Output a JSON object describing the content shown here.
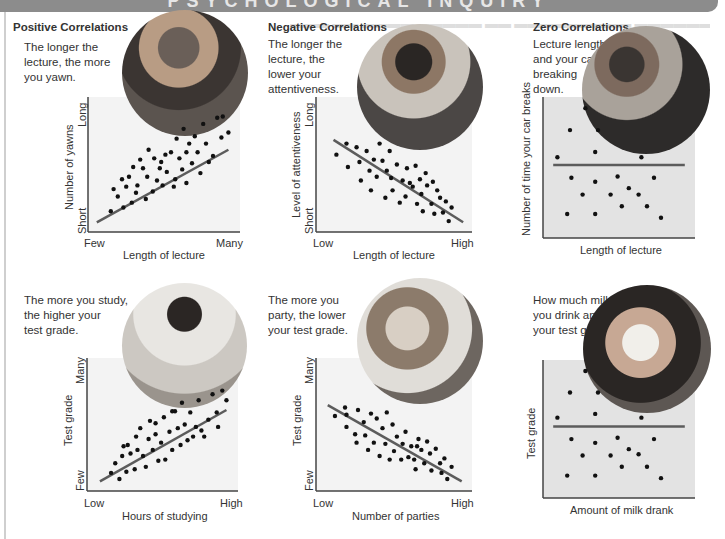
{
  "banner": {
    "title": "PSYCHOLOGICAL INQUIRY"
  },
  "sections": {
    "positive": "Positive Correlations",
    "negative": "Negative Correlations",
    "zero": "Zero Correlations"
  },
  "colors": {
    "banner": "#8c8c8c",
    "line": "#5c5c5c",
    "dot": "#111111",
    "zero_box": "#e3e3e3",
    "axis": "#444444"
  },
  "panels": [
    {
      "id": "positive-top",
      "caption": "The longer the lecture, the more you yawn.",
      "caption_lines": [
        "The longer the",
        "lecture, the more",
        "you yawn."
      ],
      "photo": "woman-yawning-photo",
      "ylabel": "Number of yawns",
      "xlabel": "Length of lecture",
      "ytick_high": "Long",
      "ytick_low": "Short",
      "xtick_low": "Few",
      "xtick_high": "Many"
    },
    {
      "id": "negative-top",
      "caption": "The longer the lecture, the lower your attentiveness.",
      "caption_lines": [
        "The longer the",
        "lecture, the",
        "lower your",
        "attentiveness."
      ],
      "photo": "student-bored-photo",
      "ylabel": "Level of attentiveness",
      "xlabel": "Length of lecture",
      "ytick_high": "Long",
      "ytick_low": "Short",
      "xtick_low": "Low",
      "xtick_high": "High"
    },
    {
      "id": "zero-top",
      "caption": "Lecture length and your car breaking down.",
      "caption_lines": [
        "Lecture length",
        "and your car",
        "breaking",
        "down."
      ],
      "photo": "mechanics-photo",
      "ylabel": "Number of time your car breaks",
      "xlabel": "Length of lecture"
    },
    {
      "id": "positive-bottom",
      "caption": "The more you study, the higher your test grade.",
      "caption_lines": [
        "The more you study,",
        "the higher your",
        "test grade."
      ],
      "photo": "student-studying-photo",
      "ylabel": "Test grade",
      "xlabel": "Hours of studying",
      "ytick_high": "Many",
      "ytick_low": "Few",
      "xtick_low": "Low",
      "xtick_high": "High"
    },
    {
      "id": "negative-bottom",
      "caption": "The more you party, the lower your test grade.",
      "caption_lines": [
        "The more you",
        "party, the lower",
        "your test grade."
      ],
      "photo": "friends-partying-photo",
      "ylabel": "Test grade",
      "xlabel": "Number of parties",
      "ytick_high": "Many",
      "ytick_low": "Few",
      "xtick_low": "Low",
      "xtick_high": "High"
    },
    {
      "id": "zero-bottom",
      "caption": "How much milk you drink and your test grade.",
      "caption_lines": [
        "How much milk",
        "you drink and",
        "your test grade."
      ],
      "photo": "woman-drinking-milk-photo",
      "ylabel": "Test grade",
      "xlabel": "Amount of milk drank"
    }
  ],
  "chart_data": [
    {
      "type": "scatter",
      "title": "Positive Correlations",
      "subtitle": "The longer the lecture, the more you yawn.",
      "xlabel": "Length of lecture",
      "ylabel": "Number of yawns",
      "x_tick_labels": [
        "Few",
        "Many"
      ],
      "y_tick_labels": [
        "Short",
        "Long"
      ],
      "xlim": [
        0,
        100
      ],
      "ylim": [
        0,
        100
      ],
      "grid": false,
      "trendline": {
        "x": [
          2,
          96
        ],
        "y": [
          3,
          62
        ]
      },
      "points": [
        [
          12,
          12
        ],
        [
          14,
          30
        ],
        [
          17,
          24
        ],
        [
          21,
          15
        ],
        [
          23,
          32
        ],
        [
          25,
          40
        ],
        [
          27,
          19
        ],
        [
          28,
          48
        ],
        [
          31,
          33
        ],
        [
          33,
          54
        ],
        [
          35,
          47
        ],
        [
          37,
          22
        ],
        [
          38,
          40
        ],
        [
          39,
          62
        ],
        [
          42,
          28
        ],
        [
          43,
          55
        ],
        [
          45,
          37
        ],
        [
          47,
          47
        ],
        [
          49,
          33
        ],
        [
          51,
          58
        ],
        [
          52,
          44
        ],
        [
          55,
          60
        ],
        [
          57,
          32
        ],
        [
          59,
          71
        ],
        [
          61,
          55
        ],
        [
          63,
          46
        ],
        [
          64,
          79
        ],
        [
          66,
          35
        ],
        [
          68,
          67
        ],
        [
          70,
          51
        ],
        [
          72,
          73
        ],
        [
          74,
          60
        ],
        [
          76,
          43
        ],
        [
          78,
          83
        ],
        [
          80,
          67
        ],
        [
          82,
          52
        ],
        [
          85,
          57
        ],
        [
          88,
          88
        ],
        [
          91,
          72
        ],
        [
          92,
          89
        ],
        [
          96,
          76
        ],
        [
          20,
          38
        ],
        [
          30,
          27
        ],
        [
          48,
          52
        ],
        [
          58,
          38
        ],
        [
          66,
          60
        ]
      ]
    },
    {
      "type": "scatter",
      "title": "Negative Correlations",
      "subtitle": "The longer the lecture, the lower your attentiveness.",
      "xlabel": "Length of lecture",
      "ylabel": "Level of attentiveness",
      "x_tick_labels": [
        "Low",
        "High"
      ],
      "y_tick_labels": [
        "Short",
        "Long"
      ],
      "xlim": [
        0,
        100
      ],
      "ylim": [
        0,
        100
      ],
      "grid": false,
      "trendline": {
        "x": [
          8,
          98
        ],
        "y": [
          70,
          3
        ]
      },
      "points": [
        [
          10,
          58
        ],
        [
          17,
          67
        ],
        [
          18,
          48
        ],
        [
          24,
          64
        ],
        [
          26,
          52
        ],
        [
          27,
          37
        ],
        [
          31,
          61
        ],
        [
          33,
          45
        ],
        [
          34,
          29
        ],
        [
          36,
          54
        ],
        [
          38,
          40
        ],
        [
          40,
          67
        ],
        [
          42,
          53
        ],
        [
          44,
          23
        ],
        [
          45,
          45
        ],
        [
          47,
          61
        ],
        [
          48,
          39
        ],
        [
          49,
          29
        ],
        [
          52,
          50
        ],
        [
          54,
          19
        ],
        [
          56,
          37
        ],
        [
          58,
          24
        ],
        [
          59,
          47
        ],
        [
          61,
          35
        ],
        [
          63,
          32
        ],
        [
          65,
          49
        ],
        [
          66,
          18
        ],
        [
          68,
          38
        ],
        [
          69,
          26
        ],
        [
          70,
          12
        ],
        [
          72,
          43
        ],
        [
          73,
          33
        ],
        [
          76,
          18
        ],
        [
          77,
          36
        ],
        [
          78,
          10
        ],
        [
          80,
          29
        ],
        [
          82,
          23
        ],
        [
          84,
          11
        ],
        [
          86,
          20
        ],
        [
          88,
          4
        ],
        [
          90,
          15
        ]
      ]
    },
    {
      "type": "scatter",
      "title": "Zero Correlations",
      "subtitle": "Lecture length and your car breaking down.",
      "xlabel": "Length of lecture",
      "ylabel": "Number of time your car breaks",
      "xlim": [
        0,
        100
      ],
      "ylim": [
        0,
        100
      ],
      "grid": false,
      "trendline": {
        "x": [
          3,
          97
        ],
        "y": [
          52,
          52
        ]
      },
      "points": [
        [
          6,
          58
        ],
        [
          15,
          79
        ],
        [
          26,
          96
        ],
        [
          35,
          79
        ],
        [
          33,
          62
        ],
        [
          16,
          42
        ],
        [
          24,
          29
        ],
        [
          33,
          39
        ],
        [
          49,
          43
        ],
        [
          57,
          34
        ],
        [
          44,
          29
        ],
        [
          66,
          58
        ],
        [
          64,
          29
        ],
        [
          75,
          42
        ],
        [
          13,
          14
        ],
        [
          33,
          14
        ],
        [
          52,
          20
        ],
        [
          70,
          20
        ],
        [
          80,
          11
        ]
      ]
    },
    {
      "type": "scatter",
      "title": "Positive Correlations",
      "subtitle": "The more you study, the higher your test grade.",
      "xlabel": "Hours of studying",
      "ylabel": "Test grade",
      "x_tick_labels": [
        "Low",
        "High"
      ],
      "y_tick_labels": [
        "Few",
        "Many"
      ],
      "xlim": [
        0,
        100
      ],
      "ylim": [
        0,
        100
      ],
      "grid": false,
      "trendline": {
        "x": [
          5,
          96
        ],
        "y": [
          3,
          62
        ]
      },
      "points": [
        [
          13,
          10
        ],
        [
          16,
          18
        ],
        [
          19,
          5
        ],
        [
          21,
          24
        ],
        [
          24,
          11
        ],
        [
          25,
          33
        ],
        [
          27,
          26
        ],
        [
          30,
          13
        ],
        [
          31,
          40
        ],
        [
          32,
          29
        ],
        [
          34,
          47
        ],
        [
          36,
          24
        ],
        [
          38,
          15
        ],
        [
          40,
          38
        ],
        [
          41,
          53
        ],
        [
          43,
          29
        ],
        [
          45,
          42
        ],
        [
          47,
          20
        ],
        [
          49,
          35
        ],
        [
          51,
          56
        ],
        [
          52,
          21
        ],
        [
          55,
          44
        ],
        [
          57,
          29
        ],
        [
          59,
          61
        ],
        [
          61,
          47
        ],
        [
          63,
          33
        ],
        [
          64,
          68
        ],
        [
          66,
          50
        ],
        [
          68,
          37
        ],
        [
          70,
          60
        ],
        [
          72,
          40
        ],
        [
          74,
          48
        ],
        [
          76,
          70
        ],
        [
          78,
          45
        ],
        [
          80,
          40
        ],
        [
          83,
          54
        ],
        [
          86,
          75
        ],
        [
          89,
          60
        ],
        [
          90,
          48
        ],
        [
          93,
          78
        ],
        [
          96,
          70
        ],
        [
          22,
          32
        ],
        [
          45,
          51
        ],
        [
          57,
          61
        ]
      ]
    },
    {
      "type": "scatter",
      "title": "Negative Correlations",
      "subtitle": "The more you party, the lower your test grade.",
      "xlabel": "Number of parties",
      "ylabel": "Test grade",
      "x_tick_labels": [
        "Low",
        "High"
      ],
      "y_tick_labels": [
        "Few",
        "Many"
      ],
      "xlim": [
        0,
        100
      ],
      "ylim": [
        0,
        100
      ],
      "grid": false,
      "trendline": {
        "x": [
          4,
          97
        ],
        "y": [
          66,
          3
        ]
      },
      "points": [
        [
          9,
          57
        ],
        [
          16,
          64
        ],
        [
          17,
          58
        ],
        [
          17,
          48
        ],
        [
          23,
          42
        ],
        [
          24,
          35
        ],
        [
          25,
          62
        ],
        [
          29,
          52
        ],
        [
          30,
          41
        ],
        [
          32,
          29
        ],
        [
          34,
          59
        ],
        [
          36,
          35
        ],
        [
          38,
          55
        ],
        [
          40,
          24
        ],
        [
          42,
          47
        ],
        [
          44,
          34
        ],
        [
          45,
          60
        ],
        [
          47,
          21
        ],
        [
          49,
          50
        ],
        [
          50,
          28
        ],
        [
          52,
          40
        ],
        [
          55,
          21
        ],
        [
          56,
          34
        ],
        [
          58,
          44
        ],
        [
          60,
          23
        ],
        [
          62,
          32
        ],
        [
          64,
          21
        ],
        [
          65,
          13
        ],
        [
          66,
          32
        ],
        [
          67,
          38
        ],
        [
          69,
          29
        ],
        [
          71,
          18
        ],
        [
          73,
          36
        ],
        [
          75,
          26
        ],
        [
          76,
          12
        ],
        [
          79,
          30
        ],
        [
          82,
          18
        ],
        [
          83,
          10
        ],
        [
          85,
          22
        ],
        [
          87,
          5
        ],
        [
          90,
          15
        ]
      ]
    },
    {
      "type": "scatter",
      "title": "Zero Correlations",
      "subtitle": "How much milk you drink and your test grade.",
      "xlabel": "Amount of milk drank",
      "ylabel": "Test grade",
      "xlim": [
        0,
        100
      ],
      "ylim": [
        0,
        100
      ],
      "grid": false,
      "trendline": {
        "x": [
          3,
          97
        ],
        "y": [
          52,
          52
        ]
      },
      "points": [
        [
          6,
          59
        ],
        [
          15,
          79
        ],
        [
          26,
          96
        ],
        [
          35,
          79
        ],
        [
          33,
          62
        ],
        [
          16,
          42
        ],
        [
          24,
          29
        ],
        [
          33,
          39
        ],
        [
          49,
          43
        ],
        [
          57,
          34
        ],
        [
          44,
          29
        ],
        [
          66,
          59
        ],
        [
          64,
          30
        ],
        [
          75,
          42
        ],
        [
          13,
          13
        ],
        [
          33,
          13
        ],
        [
          52,
          20
        ],
        [
          70,
          20
        ],
        [
          80,
          11
        ]
      ]
    }
  ]
}
